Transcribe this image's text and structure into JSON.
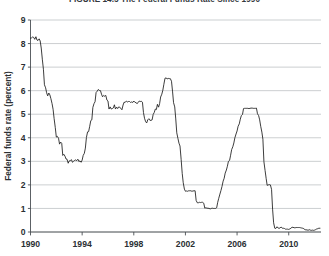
{
  "figure": {
    "title": "FIGURE 14.5 The Federal Funds Rate Since 1990"
  },
  "chart_data": {
    "type": "line",
    "title": "FIGURE 14.5 The Federal Funds Rate Since 1990",
    "xlabel": "",
    "ylabel": "Federal funds rate (percent)",
    "xlim": [
      1990,
      2012.5
    ],
    "ylim": [
      0,
      9
    ],
    "xticks": [
      1990,
      1994,
      1998,
      2002,
      2006,
      2010
    ],
    "xticklabels": [
      "1990",
      "1994",
      "1998",
      "2002",
      "2006",
      "2010"
    ],
    "yticks": [
      0,
      1,
      2,
      3,
      4,
      5,
      6,
      7,
      8,
      9
    ],
    "yticklabels": [
      "0",
      "1",
      "2",
      "3",
      "4",
      "5",
      "6",
      "7",
      "8",
      "9"
    ],
    "grid": "horizontal",
    "legend": "none",
    "line_color": "#1a1a1a",
    "grid_color": "#b6babd",
    "series": [
      {
        "name": "Federal funds rate",
        "x": [
          1990.0,
          1990.08,
          1990.17,
          1990.25,
          1990.33,
          1990.42,
          1990.5,
          1990.58,
          1990.67,
          1990.75,
          1990.83,
          1990.92,
          1991.0,
          1991.08,
          1991.17,
          1991.25,
          1991.33,
          1991.42,
          1991.5,
          1991.58,
          1991.67,
          1991.75,
          1991.83,
          1991.92,
          1992.0,
          1992.08,
          1992.17,
          1992.25,
          1992.33,
          1992.42,
          1992.5,
          1992.58,
          1992.67,
          1992.75,
          1992.83,
          1992.92,
          1993.0,
          1993.08,
          1993.17,
          1993.25,
          1993.33,
          1993.42,
          1993.5,
          1993.58,
          1993.67,
          1993.75,
          1993.83,
          1993.92,
          1994.0,
          1994.08,
          1994.17,
          1994.25,
          1994.33,
          1994.42,
          1994.5,
          1994.58,
          1994.67,
          1994.75,
          1994.83,
          1994.92,
          1995.0,
          1995.08,
          1995.17,
          1995.25,
          1995.33,
          1995.42,
          1995.5,
          1995.58,
          1995.67,
          1995.75,
          1995.83,
          1995.92,
          1996.0,
          1996.08,
          1996.17,
          1996.25,
          1996.33,
          1996.42,
          1996.5,
          1996.58,
          1996.67,
          1996.75,
          1996.83,
          1996.92,
          1997.0,
          1997.08,
          1997.17,
          1997.25,
          1997.33,
          1997.42,
          1997.5,
          1997.58,
          1997.67,
          1997.75,
          1997.83,
          1997.92,
          1998.0,
          1998.08,
          1998.17,
          1998.25,
          1998.33,
          1998.42,
          1998.5,
          1998.58,
          1998.67,
          1998.75,
          1998.83,
          1998.92,
          1999.0,
          1999.08,
          1999.17,
          1999.25,
          1999.33,
          1999.42,
          1999.5,
          1999.58,
          1999.67,
          1999.75,
          1999.83,
          1999.92,
          2000.0,
          2000.08,
          2000.17,
          2000.25,
          2000.33,
          2000.42,
          2000.5,
          2000.58,
          2000.67,
          2000.75,
          2000.83,
          2000.92,
          2001.0,
          2001.08,
          2001.17,
          2001.25,
          2001.33,
          2001.42,
          2001.5,
          2001.58,
          2001.67,
          2001.75,
          2001.83,
          2001.92,
          2002.0,
          2002.08,
          2002.17,
          2002.25,
          2002.33,
          2002.42,
          2002.5,
          2002.58,
          2002.67,
          2002.75,
          2002.83,
          2002.92,
          2003.0,
          2003.08,
          2003.17,
          2003.25,
          2003.33,
          2003.42,
          2003.5,
          2003.58,
          2003.67,
          2003.75,
          2003.83,
          2003.92,
          2004.0,
          2004.08,
          2004.17,
          2004.25,
          2004.33,
          2004.42,
          2004.5,
          2004.58,
          2004.67,
          2004.75,
          2004.83,
          2004.92,
          2005.0,
          2005.08,
          2005.17,
          2005.25,
          2005.33,
          2005.42,
          2005.5,
          2005.58,
          2005.67,
          2005.75,
          2005.83,
          2005.92,
          2006.0,
          2006.08,
          2006.17,
          2006.25,
          2006.33,
          2006.42,
          2006.5,
          2006.58,
          2006.67,
          2006.75,
          2006.83,
          2006.92,
          2007.0,
          2007.08,
          2007.17,
          2007.25,
          2007.33,
          2007.42,
          2007.5,
          2007.58,
          2007.67,
          2007.75,
          2007.83,
          2007.92,
          2008.0,
          2008.08,
          2008.17,
          2008.25,
          2008.33,
          2008.42,
          2008.5,
          2008.58,
          2008.67,
          2008.75,
          2008.83,
          2008.92,
          2009.0,
          2009.08,
          2009.17,
          2009.25,
          2009.33,
          2009.42,
          2009.5,
          2009.58,
          2009.67,
          2009.75,
          2009.83,
          2009.92,
          2010.0,
          2010.08,
          2010.17,
          2010.25,
          2010.33,
          2010.42,
          2010.5,
          2010.58,
          2010.67,
          2010.75,
          2010.83,
          2010.92,
          2011.0,
          2011.08,
          2011.17,
          2011.25,
          2011.33,
          2011.42,
          2011.5,
          2011.58,
          2011.67,
          2011.75,
          2011.83,
          2011.92,
          2012.0,
          2012.08,
          2012.17,
          2012.25,
          2012.33,
          2012.42
        ],
        "values": [
          8.23,
          8.24,
          8.28,
          8.26,
          8.18,
          8.29,
          8.15,
          8.13,
          8.2,
          8.11,
          7.81,
          7.31,
          6.91,
          6.25,
          6.12,
          5.91,
          5.78,
          5.9,
          5.82,
          5.66,
          5.45,
          5.21,
          4.81,
          4.43,
          4.03,
          4.06,
          3.98,
          3.73,
          3.82,
          3.76,
          3.25,
          3.3,
          3.22,
          3.1,
          3.09,
          2.92,
          3.02,
          3.03,
          3.07,
          2.96,
          3.0,
          3.04,
          3.06,
          3.03,
          3.09,
          2.99,
          3.02,
          2.96,
          3.05,
          3.25,
          3.34,
          3.56,
          4.01,
          4.25,
          4.26,
          4.47,
          4.73,
          4.76,
          5.29,
          5.45,
          5.53,
          5.92,
          5.98,
          6.05,
          6.01,
          6.0,
          5.85,
          5.74,
          5.8,
          5.76,
          5.8,
          5.6,
          5.56,
          5.22,
          5.31,
          5.22,
          5.24,
          5.27,
          5.4,
          5.22,
          5.3,
          5.24,
          5.31,
          5.29,
          5.25,
          5.19,
          5.39,
          5.51,
          5.5,
          5.56,
          5.52,
          5.54,
          5.54,
          5.5,
          5.52,
          5.5,
          5.56,
          5.51,
          5.49,
          5.45,
          5.49,
          5.56,
          5.54,
          5.55,
          5.51,
          5.07,
          4.83,
          4.68,
          4.63,
          4.76,
          4.81,
          4.74,
          4.74,
          4.76,
          4.99,
          5.07,
          5.22,
          5.2,
          5.42,
          5.3,
          5.45,
          5.73,
          5.85,
          6.02,
          6.27,
          6.53,
          6.54,
          6.5,
          6.52,
          6.51,
          6.51,
          6.4,
          5.98,
          5.49,
          5.31,
          4.8,
          4.21,
          3.97,
          3.77,
          3.65,
          3.07,
          2.49,
          2.09,
          1.82,
          1.73,
          1.74,
          1.73,
          1.75,
          1.75,
          1.75,
          1.73,
          1.74,
          1.75,
          1.75,
          1.34,
          1.24,
          1.24,
          1.26,
          1.25,
          1.26,
          1.26,
          1.22,
          1.01,
          1.03,
          1.01,
          1.01,
          1.0,
          0.98,
          1.0,
          1.01,
          1.0,
          1.0,
          1.0,
          1.03,
          1.26,
          1.43,
          1.61,
          1.76,
          1.93,
          2.16,
          2.28,
          2.5,
          2.63,
          2.79,
          3.0,
          3.04,
          3.26,
          3.5,
          3.62,
          3.78,
          4.0,
          4.16,
          4.29,
          4.49,
          4.59,
          4.79,
          4.94,
          4.99,
          5.24,
          5.25,
          5.25,
          5.25,
          5.25,
          5.24,
          5.25,
          5.26,
          5.26,
          5.25,
          5.25,
          5.25,
          5.26,
          5.02,
          4.94,
          4.76,
          4.49,
          4.24,
          3.94,
          2.98,
          2.61,
          2.28,
          1.98,
          2.0,
          2.01,
          2.0,
          1.81,
          0.97,
          0.39,
          0.16,
          0.15,
          0.22,
          0.18,
          0.15,
          0.18,
          0.21,
          0.16,
          0.16,
          0.15,
          0.12,
          0.12,
          0.12,
          0.11,
          0.13,
          0.16,
          0.2,
          0.2,
          0.18,
          0.18,
          0.19,
          0.19,
          0.19,
          0.19,
          0.18,
          0.17,
          0.16,
          0.14,
          0.1,
          0.09,
          0.09,
          0.07,
          0.1,
          0.08,
          0.07,
          0.08,
          0.07,
          0.08,
          0.1,
          0.13,
          0.14,
          0.16,
          0.16
        ]
      }
    ]
  },
  "axes": {
    "y_axis_title": "Federal funds rate (percent)",
    "y_ticks": [
      "9",
      "8",
      "7",
      "6",
      "5",
      "4",
      "3",
      "2",
      "1",
      "0"
    ],
    "x_ticks": [
      "1990",
      "1994",
      "1998",
      "2002",
      "2006",
      "2010"
    ]
  }
}
